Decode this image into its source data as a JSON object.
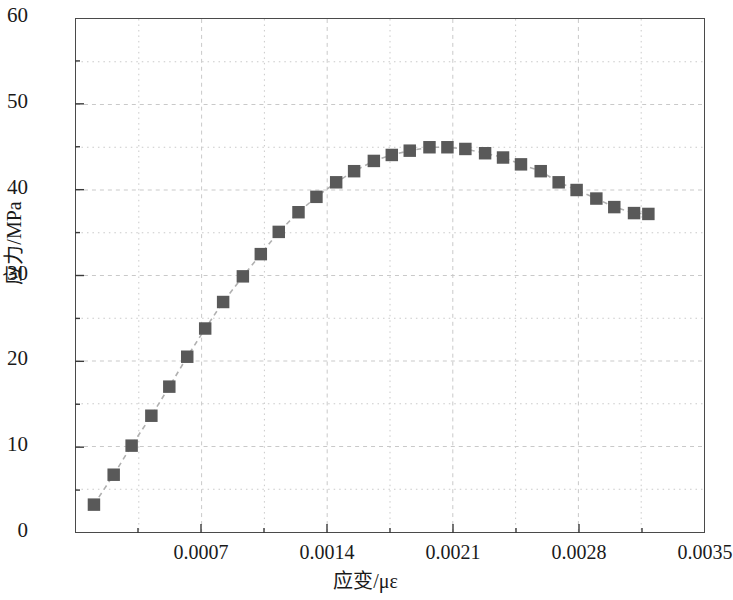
{
  "chart_data": {
    "type": "line",
    "title": "",
    "xlabel": "应变/με",
    "ylabel": "应力/MPa",
    "xlim": [
      0,
      0.0035
    ],
    "ylim": [
      0,
      60
    ],
    "xticks": [
      0.0007,
      0.0014,
      0.0021,
      0.0028,
      0.0035
    ],
    "xtick_labels": [
      "0.0007",
      "0.0014",
      "0.0021",
      "0.0028",
      "0.0035"
    ],
    "yticks": [
      0,
      10,
      20,
      30,
      40,
      50,
      60
    ],
    "ytick_labels": [
      "0",
      "10",
      "20",
      "30",
      "40",
      "50",
      "60"
    ],
    "xminor_step": 0.00035,
    "yminor_step": 5,
    "grid": "dotted-minor-and-major",
    "legend": "none",
    "marker": "square",
    "marker_color": "#595959",
    "line_style": "dashed",
    "line_color": "#b0b0b0",
    "axis_color": "#4a4a4a",
    "series": [
      {
        "name": "应力-应变曲线",
        "x": [
          0.0001,
          0.00021,
          0.00031,
          0.00042,
          0.00052,
          0.00062,
          0.00072,
          0.00082,
          0.00093,
          0.00103,
          0.00113,
          0.00124,
          0.00134,
          0.00145,
          0.00155,
          0.00166,
          0.00176,
          0.00186,
          0.00197,
          0.00207,
          0.00217,
          0.00228,
          0.00238,
          0.00248,
          0.00259,
          0.00269,
          0.00279,
          0.0029,
          0.003,
          0.00311,
          0.00319
        ],
        "y": [
          3.2,
          6.7,
          10.1,
          13.6,
          17.0,
          20.5,
          23.8,
          26.9,
          29.9,
          32.5,
          35.1,
          37.4,
          39.2,
          40.9,
          42.2,
          43.4,
          44.1,
          44.6,
          45.0,
          45.0,
          44.8,
          44.3,
          43.8,
          43.0,
          42.2,
          40.9,
          40.0,
          39.0,
          38.0,
          37.3,
          37.2
        ]
      }
    ]
  },
  "figure": {
    "background": "#ffffff",
    "width": 731,
    "height": 600
  }
}
